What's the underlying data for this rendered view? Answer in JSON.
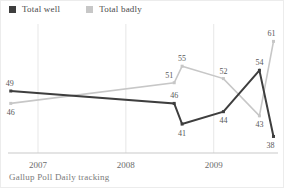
{
  "source": "Gallup Poll Daily tracking",
  "chart_data": {
    "type": "line",
    "title": "",
    "xlabel": "",
    "ylabel": "",
    "x_years": [
      2006.69,
      2008.55,
      2008.64,
      2009.11,
      2009.52,
      2009.68
    ],
    "series": [
      {
        "name": "Total well",
        "color": "#3e3e3e",
        "values": [
          49,
          46,
          41,
          44,
          54,
          38
        ],
        "labels": [
          "49",
          "46",
          "41",
          "44",
          "54",
          "38"
        ],
        "label_pos": [
          "above",
          "above",
          "below",
          "below",
          "above",
          "below"
        ],
        "label_dx": [
          -1,
          0,
          0,
          0,
          0,
          -3
        ],
        "line_width": 2
      },
      {
        "name": "Total badly",
        "color": "#c7c7c7",
        "values": [
          46,
          51,
          55,
          52,
          43,
          61
        ],
        "labels": [
          "46",
          "51",
          "55",
          "52",
          "43",
          "61"
        ],
        "label_pos": [
          "below",
          "above",
          "above",
          "above",
          "below",
          "above"
        ],
        "label_dx": [
          0,
          -5,
          0,
          0,
          0,
          -2
        ],
        "line_width": 1.6
      }
    ],
    "xticks": [
      {
        "year": 2007,
        "label": "2007"
      },
      {
        "year": 2008,
        "label": "2008"
      },
      {
        "year": 2009,
        "label": "2009"
      }
    ],
    "xlim": [
      2006.67,
      2009.72
    ],
    "ylim": [
      34,
      64
    ],
    "grid": "vertical-only",
    "legend_position": "top-left",
    "colors": {
      "point_label": "#585858",
      "tick_label": "#6b6b6b",
      "gridline": "#e7e7e7",
      "axis_line": "#c9c9c9"
    }
  }
}
